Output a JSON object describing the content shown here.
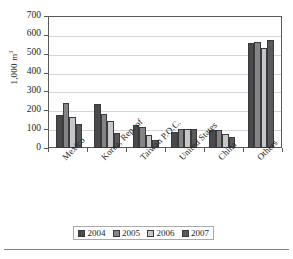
{
  "chart_data": {
    "type": "bar",
    "title": "",
    "xlabel": "",
    "ylabel": "1,000 m",
    "ylabel_sup": "3",
    "ylim": [
      0,
      700
    ],
    "ytick_step": 100,
    "yticks": [
      700,
      600,
      500,
      400,
      300,
      200,
      100,
      0
    ],
    "grid": true,
    "legend_position": "bottom",
    "categories": [
      "Mexico",
      "Korea, Rep. of",
      "Taiwan P.O.C.",
      "United States",
      "China",
      "Others"
    ],
    "series": [
      {
        "name": "2004",
        "color": "#4a4a4c",
        "values": [
          175,
          233,
          120,
          85,
          93,
          555
        ]
      },
      {
        "name": "2005",
        "color": "#848487",
        "values": [
          238,
          183,
          110,
          100,
          95,
          560
        ]
      },
      {
        "name": "2006",
        "color": "#c6c6c8",
        "values": [
          165,
          145,
          70,
          100,
          72,
          530
        ]
      },
      {
        "name": "2007",
        "color": "#5a5a5c",
        "values": [
          128,
          78,
          42,
          100,
          60,
          575
        ]
      }
    ]
  },
  "legend": {
    "items": [
      {
        "label": "2004"
      },
      {
        "label": "2005"
      },
      {
        "label": "2006"
      },
      {
        "label": "2007"
      }
    ]
  },
  "colors": {
    "axis": "#58595b",
    "grid": "#d4d5d7",
    "text": "#231f20",
    "background": "#ffffff"
  }
}
